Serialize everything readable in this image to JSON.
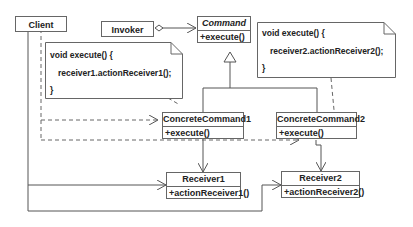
{
  "diagram": {
    "type": "UML class diagram",
    "pattern": "Command",
    "classes": {
      "client": {
        "name": "Client"
      },
      "invoker": {
        "name": "Invoker"
      },
      "command": {
        "name": "Command",
        "abstract": true,
        "op": "+execute()"
      },
      "concrete1": {
        "name": "ConcreteCommand1",
        "op": "+execute()"
      },
      "concrete2": {
        "name": "ConcreteCommand2",
        "op": "+execute()"
      },
      "receiver1": {
        "name": "Receiver1",
        "op": "+actionReceiver1()"
      },
      "receiver2": {
        "name": "Receiver2",
        "op": "+actionReceiver2()"
      }
    },
    "notes": {
      "note1": {
        "line1": "void execute() {",
        "line2": "receiver1.actionReceiver1();",
        "line3": "}"
      },
      "note2": {
        "line1": "void execute() {",
        "line2": "receiver2.actionReceiver2();",
        "line3": "}"
      }
    },
    "relations": [
      {
        "from": "Invoker",
        "to": "Command",
        "type": "aggregation"
      },
      {
        "from": "ConcreteCommand1",
        "to": "Command",
        "type": "generalization"
      },
      {
        "from": "ConcreteCommand2",
        "to": "Command",
        "type": "generalization"
      },
      {
        "from": "ConcreteCommand1",
        "to": "Receiver1",
        "type": "association"
      },
      {
        "from": "ConcreteCommand2",
        "to": "Receiver2",
        "type": "association"
      },
      {
        "from": "Client",
        "to": "ConcreteCommand1",
        "type": "dependency"
      },
      {
        "from": "Client",
        "to": "ConcreteCommand2",
        "type": "dependency"
      },
      {
        "from": "Client",
        "to": "Receiver1",
        "type": "association"
      },
      {
        "from": "Client",
        "to": "Receiver2",
        "type": "association"
      }
    ]
  }
}
